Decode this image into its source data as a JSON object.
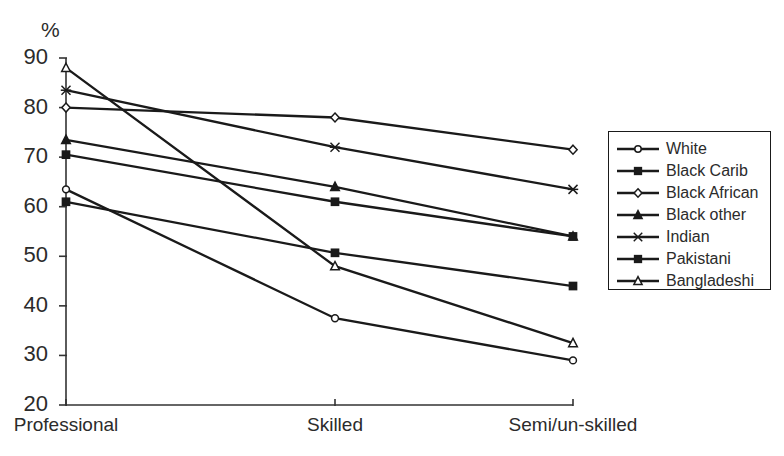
{
  "chart_data": {
    "type": "line",
    "title": "",
    "subtitle": "",
    "xlabel": "",
    "ylabel": "%",
    "categories": [
      "Professional",
      "Skilled",
      "Semi/un-skilled"
    ],
    "ylim": [
      20,
      90
    ],
    "yticks": [
      20,
      30,
      40,
      50,
      60,
      70,
      80,
      90
    ],
    "ytick_labels": [
      "20",
      "30",
      "40",
      "50",
      "60",
      "70",
      "80",
      "90"
    ],
    "grid": false,
    "legend_position": "right",
    "series": [
      {
        "name": "White",
        "marker": "open-circle",
        "values": [
          63.5,
          37.5,
          29.0
        ]
      },
      {
        "name": "Black Carib",
        "marker": "filled-square",
        "values": [
          61.0,
          50.7,
          44.0
        ]
      },
      {
        "name": "Black African",
        "marker": "open-diamond",
        "values": [
          80.0,
          78.0,
          71.5
        ]
      },
      {
        "name": "Black other",
        "marker": "filled-triangle",
        "values": [
          73.5,
          64.0,
          54.0
        ]
      },
      {
        "name": "Indian",
        "marker": "cross",
        "values": [
          83.5,
          72.0,
          63.5
        ]
      },
      {
        "name": "Pakistani",
        "marker": "filled-square",
        "values": [
          70.5,
          61.0,
          54.0
        ]
      },
      {
        "name": "Bangladeshi",
        "marker": "open-triangle",
        "values": [
          88.0,
          48.0,
          32.5
        ]
      }
    ],
    "line_color": "#1a1a1a",
    "axis_color": "#333333"
  },
  "axis": {
    "unit_label": "%"
  },
  "legend": {
    "items": [
      {
        "label": "White"
      },
      {
        "label": "Black Carib"
      },
      {
        "label": "Black African"
      },
      {
        "label": "Black other"
      },
      {
        "label": "Indian"
      },
      {
        "label": "Pakistani"
      },
      {
        "label": "Bangladeshi"
      }
    ]
  }
}
